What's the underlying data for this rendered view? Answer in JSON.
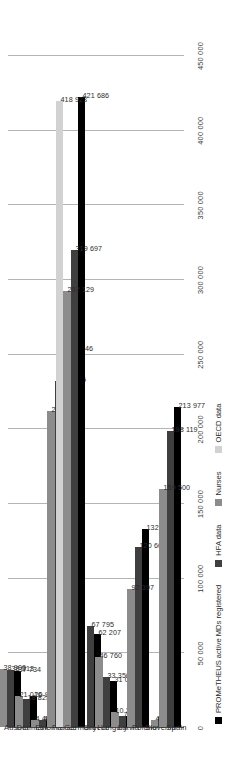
{
  "chart_data": {
    "type": "bar",
    "orientation": "vertical-rotated",
    "title": "",
    "subtitle": "",
    "xlabel": "",
    "ylabel": "",
    "ylim": [
      0,
      450000
    ],
    "grid": true,
    "legend_position": "bottom",
    "categories": [
      "Austria",
      "Denmark",
      "Estonia",
      "France",
      "Germany",
      "Greece",
      "Hungary",
      "Latvia",
      "Poland",
      "Slovenia",
      "Spain"
    ],
    "tick_labels": [
      "0",
      "50 000",
      "100 000",
      "150 000",
      "200 000",
      "250 000",
      "300 000",
      "350 000",
      "400 000",
      "450 000"
    ],
    "tick_values": [
      0,
      50000,
      100000,
      150000,
      200000,
      250000,
      300000,
      350000,
      400000,
      450000
    ],
    "series": [
      {
        "name": "PROMeTHEUS active MDs registered",
        "color": "#000000",
        "values": [
          37734,
          20972,
          5524,
          252746,
          421686,
          62207,
          31024,
          7040,
          132638,
          null,
          213977
        ],
        "labels": [
          "37 734",
          "20 972",
          "5 524",
          "252 746",
          "421 686",
          "62 207",
          "31 024",
          "7 040",
          "132 638",
          "",
          "213 977"
        ]
      },
      {
        "name": "HFA data",
        "color": "#3f3f3f",
        "values": [
          38313,
          18825,
          4612,
          231995,
          319697,
          67795,
          33350,
          7080,
          120663,
          6642,
          198119
        ],
        "labels": [
          "38 313",
          "18 825",
          "4 612",
          "231 995",
          "319 697",
          "67 795",
          "33 350",
          "7 080",
          "120 663",
          "6 642",
          "198 119"
        ]
      },
      {
        "name": "Nurses",
        "color": "#8c8c8c",
        "values": [
          38900,
          21016,
          4469,
          211521,
          292129,
          null,
          46760,
          10239,
          92397,
          4854,
          159500
        ],
        "labels": [
          "38 900",
          "21 016",
          "4 469",
          "211 521",
          "292 129",
          "",
          "46 760",
          "10 239",
          "92 397",
          "4 854",
          "159 500"
        ]
      },
      {
        "name": "OECD data",
        "color": "#d2d2d2",
        "values": [
          null,
          null,
          null,
          null,
          418923,
          null,
          null,
          null,
          null,
          null,
          null
        ],
        "labels": [
          "",
          "",
          "",
          "",
          "418 923",
          "",
          "",
          "",
          "",
          "",
          ""
        ]
      }
    ]
  },
  "legend": {
    "items": [
      {
        "label": "PROMeTHEUS active MDs registered",
        "color": "#000000"
      },
      {
        "label": "HFA data",
        "color": "#3f3f3f"
      },
      {
        "label": "Nurses",
        "color": "#8c8c8c"
      },
      {
        "label": "OECD data",
        "color": "#d2d2d2"
      }
    ]
  }
}
